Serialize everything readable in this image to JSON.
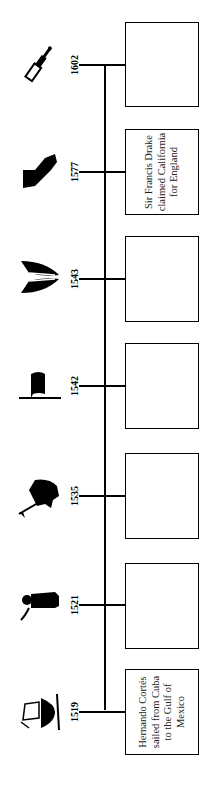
{
  "timeline": {
    "orientation": "rotated-90-ccw",
    "events": [
      {
        "year": "1602",
        "icon": "telescope-icon",
        "text": ""
      },
      {
        "year": "1577",
        "icon": "california-map-icon",
        "text": "Sir Francis Drake claimed California for England"
      },
      {
        "year": "1543",
        "icon": "feathers-icon",
        "text": ""
      },
      {
        "year": "1542",
        "icon": "flag-icon",
        "text": ""
      },
      {
        "year": "1535",
        "icon": "conquistador-on-horse-icon",
        "text": ""
      },
      {
        "year": "1521",
        "icon": "soldier-icon",
        "text": ""
      },
      {
        "year": "1519",
        "icon": "sailing-ship-icon",
        "text": "Hernando Cortés sailed from Cuba to the Gulf of Mexico"
      }
    ]
  }
}
